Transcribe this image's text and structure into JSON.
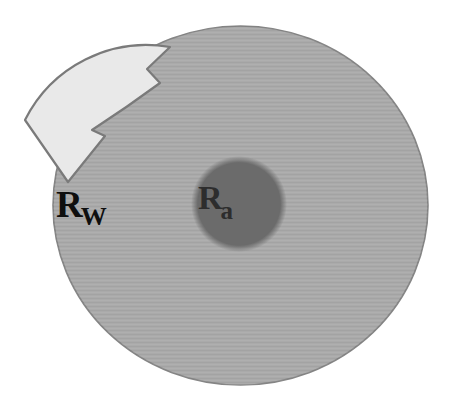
{
  "figure": {
    "outer_label": {
      "main": "R",
      "sub": "W"
    },
    "inner_label": {
      "main": "R",
      "sub": "a"
    },
    "colors": {
      "background": "#ffffff",
      "outer_disk_fill": "#aaaaaa",
      "outer_disk_edge": "#858585",
      "inner_disk_fill": "#6b6b6b",
      "arrow_fill": "#e9e9e9",
      "arrow_edge": "#7a7a7a",
      "outer_label_color": "#0f0f0f",
      "inner_label_color": "#2d2d2d"
    }
  }
}
